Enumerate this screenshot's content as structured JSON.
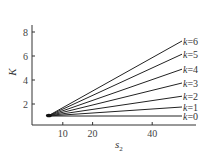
{
  "chart_data": {
    "type": "line",
    "title": "",
    "xlabel": "s₂",
    "ylabel": "K",
    "xlim": [
      0,
      54
    ],
    "ylim": [
      0,
      8.7
    ],
    "xticks": [
      10,
      20,
      40
    ],
    "yticks": [
      2,
      4,
      6,
      8
    ],
    "grid": false,
    "legend_position": "inline-right",
    "series": [
      {
        "name": "k=0",
        "k": 0,
        "x": [
          5,
          50
        ],
        "values": [
          1.0,
          1.0
        ]
      },
      {
        "name": "k=1",
        "k": 1,
        "x": [
          5,
          50
        ],
        "values": [
          1.0,
          1.75
        ]
      },
      {
        "name": "k=2",
        "k": 2,
        "x": [
          5,
          50
        ],
        "values": [
          1.0,
          2.65
        ]
      },
      {
        "name": "k=3",
        "k": 3,
        "x": [
          5,
          50
        ],
        "values": [
          1.0,
          3.75
        ]
      },
      {
        "name": "k=4",
        "k": 4,
        "x": [
          5,
          50
        ],
        "values": [
          1.0,
          4.9
        ]
      },
      {
        "name": "k=5",
        "k": 5,
        "x": [
          5,
          50
        ],
        "values": [
          1.0,
          6.15
        ]
      },
      {
        "name": "k=6",
        "k": 6,
        "x": [
          5,
          50
        ],
        "values": [
          1.0,
          7.25
        ]
      }
    ]
  },
  "labels": {
    "ylabel": "K",
    "xlabel_main": "s",
    "xlabel_sub": "2",
    "series_prefix": "k"
  }
}
